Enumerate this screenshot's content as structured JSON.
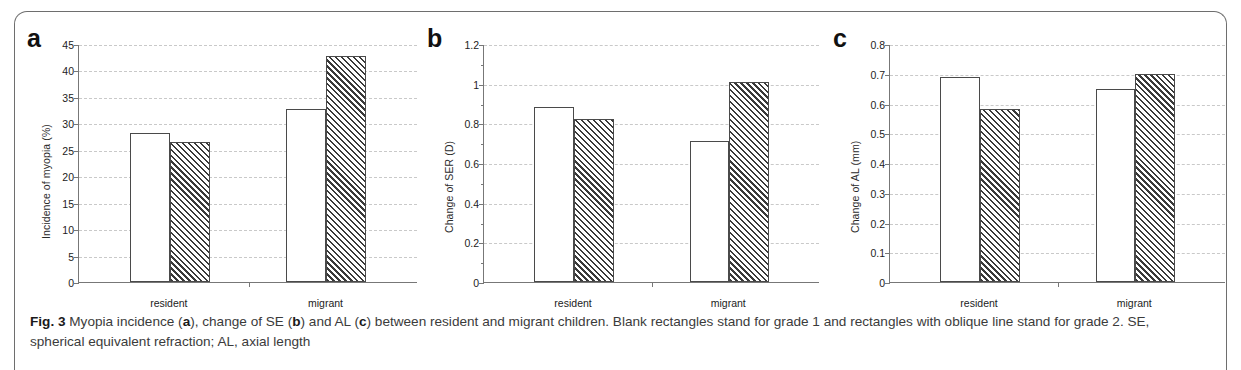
{
  "figure": {
    "caption_prefix": "Fig. 3",
    "caption_text": " Myopia incidence (a), change of SE (b) and AL (c) between resident and migrant children. Blank rectangles stand for grade 1 and rectangles with oblique line stand for grade 2. SE, spherical equivalent refraction; AL, axial length",
    "caption_part1": " Myopia incidence (",
    "caption_lbl_a": "a",
    "caption_part2": "), change of SE (",
    "caption_lbl_b": "b",
    "caption_part3": ") and AL (",
    "caption_lbl_c": "c",
    "caption_part4": ") between resident and migrant children. Blank rectangles stand for grade 1 and rectangles with oblique line stand for grade 2. SE, spherical equivalent refraction; AL, axial length"
  },
  "panels": {
    "a": {
      "letter": "a"
    },
    "b": {
      "letter": "b"
    },
    "c": {
      "letter": "c"
    }
  },
  "chart_data": [
    {
      "panel": "a",
      "type": "bar",
      "title": "",
      "ylabel": "Incidence of myopia (%)",
      "xlabel": "",
      "categories": [
        "resident",
        "migrant"
      ],
      "series": [
        {
          "name": "grade 1",
          "style": "blank",
          "values": [
            28.2,
            32.7
          ]
        },
        {
          "name": "grade 2",
          "style": "oblique line",
          "values": [
            26.5,
            42.8
          ]
        }
      ],
      "ylim": [
        0,
        45
      ],
      "yticks": [
        0,
        5,
        10,
        15,
        20,
        25,
        30,
        35,
        40,
        45
      ],
      "ytick_labels": [
        "0",
        "5",
        "10",
        "15",
        "20",
        "25",
        "30",
        "35",
        "40",
        "45"
      ],
      "grid": true,
      "legend": "none"
    },
    {
      "panel": "b",
      "type": "bar",
      "title": "",
      "ylabel": "Change of SER (D)",
      "xlabel": "",
      "categories": [
        "resident",
        "migrant"
      ],
      "series": [
        {
          "name": "grade 1",
          "style": "blank",
          "values": [
            0.88,
            0.71
          ]
        },
        {
          "name": "grade 2",
          "style": "oblique line",
          "values": [
            0.82,
            1.01
          ]
        }
      ],
      "ylim": [
        0,
        1.2
      ],
      "yticks": [
        0,
        0.2,
        0.4,
        0.6,
        0.8,
        1,
        1.2
      ],
      "ytick_labels": [
        "0",
        "0.2",
        "0.4",
        "0.6",
        "0.8",
        "1",
        "1.2"
      ],
      "grid": true,
      "legend": "none"
    },
    {
      "panel": "c",
      "type": "bar",
      "title": "",
      "ylabel": "Change of AL (mm)",
      "xlabel": "",
      "categories": [
        "resident",
        "migrant"
      ],
      "series": [
        {
          "name": "grade 1",
          "style": "blank",
          "values": [
            0.69,
            0.65
          ]
        },
        {
          "name": "grade 2",
          "style": "oblique line",
          "values": [
            0.58,
            0.7
          ]
        }
      ],
      "ylim": [
        0,
        0.8
      ],
      "yticks": [
        0,
        0.1,
        0.2,
        0.3,
        0.4,
        0.5,
        0.6,
        0.7,
        0.8
      ],
      "ytick_labels": [
        "0",
        "0.1",
        "0.2",
        "0.3",
        "0.4",
        "0.5",
        "0.6",
        "0.7",
        "0.8"
      ],
      "grid": true,
      "legend": "none"
    }
  ]
}
